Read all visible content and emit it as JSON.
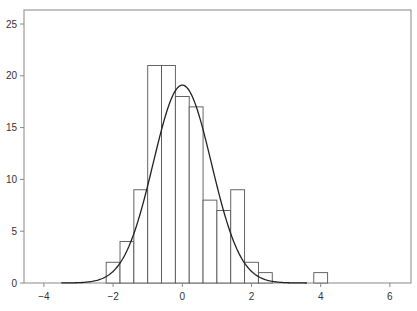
{
  "chart_data": {
    "type": "bar",
    "subtype": "histogram_with_normal_curve",
    "title": "",
    "xlabel": "",
    "ylabel": "",
    "xlim": [
      -4.6,
      6.6
    ],
    "ylim": [
      0,
      26.5
    ],
    "xticks": [
      -4,
      -2,
      0,
      2,
      4,
      6
    ],
    "xtick_labels": [
      "−4",
      "−2",
      "0",
      "2",
      "4",
      "6"
    ],
    "yticks": [
      0,
      5,
      10,
      15,
      20,
      25
    ],
    "ytick_labels": [
      "0",
      "5",
      "10",
      "15",
      "20",
      "25"
    ],
    "grid": false,
    "legend": null,
    "bins": [
      {
        "left": -2.2,
        "right": -1.8,
        "count": 2
      },
      {
        "left": -1.8,
        "right": -1.4,
        "count": 4
      },
      {
        "left": -1.4,
        "right": -1.0,
        "count": 9
      },
      {
        "left": -1.0,
        "right": -0.6,
        "count": 21
      },
      {
        "left": -0.6,
        "right": -0.2,
        "count": 21
      },
      {
        "left": -0.2,
        "right": 0.2,
        "count": 18
      },
      {
        "left": 0.2,
        "right": 0.6,
        "count": 17
      },
      {
        "left": 0.6,
        "right": 1.0,
        "count": 8
      },
      {
        "left": 1.0,
        "right": 1.4,
        "count": 7
      },
      {
        "left": 1.4,
        "right": 1.8,
        "count": 9
      },
      {
        "left": 1.8,
        "right": 2.2,
        "count": 2
      },
      {
        "left": 2.2,
        "right": 2.6,
        "count": 1
      },
      {
        "left": 3.8,
        "right": 4.2,
        "count": 1
      }
    ],
    "curve": {
      "type": "normal",
      "mean": 0.0,
      "sd": 0.84,
      "peak": 19.1,
      "x_range": [
        -3.5,
        3.6
      ]
    }
  },
  "colors": {
    "bar_fill": "#ffffff",
    "bar_stroke": "#555555",
    "curve": "#222222",
    "axis": "#888888"
  }
}
